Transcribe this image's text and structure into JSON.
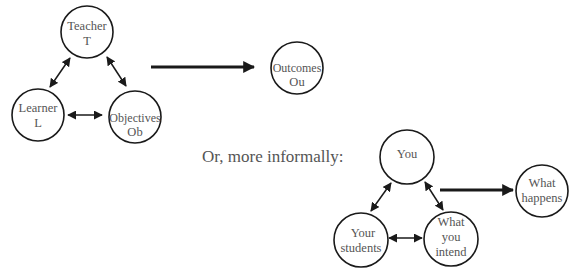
{
  "diagram": {
    "formal": {
      "nodes": {
        "teacher": {
          "line1": "Teacher",
          "line2": "T"
        },
        "learner": {
          "line1": "Learner",
          "line2": "L"
        },
        "objectives": {
          "line1": "Objectives",
          "line2": "Ob"
        },
        "outcomes": {
          "line1": "Outcomes",
          "line2": "Ou"
        }
      }
    },
    "caption": "Or, more informally:",
    "informal": {
      "nodes": {
        "you": {
          "line1": "You"
        },
        "students": {
          "line1": "Your",
          "line2": "students"
        },
        "intend": {
          "line1": "What",
          "line2": "you",
          "line3": "intend"
        },
        "happens": {
          "line1": "What",
          "line2": "happens"
        }
      }
    },
    "colors": {
      "stroke": "#1a1a1a",
      "text": "#555555"
    }
  }
}
